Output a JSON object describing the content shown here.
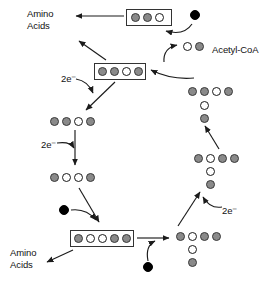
{
  "diagram": {
    "palette": {
      "gray": "#8a8a8a",
      "white": "#ffffff",
      "black": "#000000",
      "stroke": "#333333",
      "text": "#111111"
    },
    "labels": [
      {
        "id": "amino-acids-top",
        "text": "Amino\nAcids",
        "x": 27,
        "y": 8
      },
      {
        "id": "acetyl-coa",
        "text": "Acetyl-CoA",
        "x": 212,
        "y": 44
      },
      {
        "id": "two-electrons-upper",
        "text": "2e⁻",
        "x": 61,
        "y": 73
      },
      {
        "id": "two-electrons-mid",
        "text": "2e⁻",
        "x": 41,
        "y": 139
      },
      {
        "id": "two-electrons-lower",
        "text": "2e⁻",
        "x": 222,
        "y": 205
      },
      {
        "id": "amino-acids-bottom",
        "text": "Amino\nAcids",
        "x": 10,
        "y": 247
      }
    ],
    "molecules": [
      {
        "id": "molecule-top-boxed",
        "boxed": true,
        "box": {
          "x": 126,
          "y": 9,
          "w": 46,
          "h": 17
        },
        "circles": [
          {
            "fill": "gray",
            "x": 131,
            "y": 13,
            "d": 9
          },
          {
            "fill": "gray",
            "x": 143,
            "y": 13,
            "d": 9
          },
          {
            "fill": "white",
            "x": 155,
            "y": 13,
            "d": 9
          }
        ]
      },
      {
        "id": "molecule-input-top-black",
        "boxed": false,
        "circles": [
          {
            "fill": "black",
            "x": 190,
            "y": 10,
            "d": 10
          }
        ]
      },
      {
        "id": "molecule-acetyl-coa",
        "boxed": false,
        "circles": [
          {
            "fill": "white",
            "x": 183,
            "y": 42,
            "d": 9
          },
          {
            "fill": "gray",
            "x": 195,
            "y": 42,
            "d": 9
          }
        ]
      },
      {
        "id": "molecule-left-boxed-four",
        "boxed": true,
        "box": {
          "x": 94,
          "y": 63,
          "w": 52,
          "h": 17
        },
        "circles": [
          {
            "fill": "gray",
            "x": 98,
            "y": 67,
            "d": 9
          },
          {
            "fill": "gray",
            "x": 110,
            "y": 67,
            "d": 9
          },
          {
            "fill": "white",
            "x": 122,
            "y": 67,
            "d": 9
          },
          {
            "fill": "gray",
            "x": 134,
            "y": 67,
            "d": 9
          }
        ]
      },
      {
        "id": "molecule-right-branched-upper",
        "boxed": false,
        "circles": [
          {
            "fill": "gray",
            "x": 188,
            "y": 87,
            "d": 9
          },
          {
            "fill": "gray",
            "x": 200,
            "y": 87,
            "d": 9
          },
          {
            "fill": "white",
            "x": 212,
            "y": 87,
            "d": 9
          },
          {
            "fill": "gray",
            "x": 224,
            "y": 87,
            "d": 9
          },
          {
            "fill": "white",
            "x": 200,
            "y": 101,
            "d": 9
          },
          {
            "fill": "gray",
            "x": 200,
            "y": 114,
            "d": 9
          }
        ]
      },
      {
        "id": "molecule-left-four-open",
        "boxed": false,
        "circles": [
          {
            "fill": "gray",
            "x": 50,
            "y": 117,
            "d": 9
          },
          {
            "fill": "gray",
            "x": 62,
            "y": 117,
            "d": 9
          },
          {
            "fill": "white",
            "x": 74,
            "y": 117,
            "d": 9
          },
          {
            "fill": "gray",
            "x": 86,
            "y": 117,
            "d": 9
          }
        ]
      },
      {
        "id": "molecule-left-four-two-white",
        "boxed": false,
        "circles": [
          {
            "fill": "gray",
            "x": 50,
            "y": 173,
            "d": 9
          },
          {
            "fill": "white",
            "x": 62,
            "y": 173,
            "d": 9
          },
          {
            "fill": "white",
            "x": 74,
            "y": 173,
            "d": 9
          },
          {
            "fill": "gray",
            "x": 86,
            "y": 173,
            "d": 9
          }
        ]
      },
      {
        "id": "molecule-right-branched-mid",
        "boxed": false,
        "circles": [
          {
            "fill": "gray",
            "x": 194,
            "y": 154,
            "d": 9
          },
          {
            "fill": "white",
            "x": 206,
            "y": 154,
            "d": 9
          },
          {
            "fill": "gray",
            "x": 218,
            "y": 154,
            "d": 9
          },
          {
            "fill": "gray",
            "x": 230,
            "y": 154,
            "d": 9
          },
          {
            "fill": "white",
            "x": 206,
            "y": 167,
            "d": 9
          },
          {
            "fill": "gray",
            "x": 206,
            "y": 180,
            "d": 9
          }
        ]
      },
      {
        "id": "molecule-input-lower-left-black",
        "boxed": false,
        "circles": [
          {
            "fill": "black",
            "x": 59,
            "y": 205,
            "d": 10
          }
        ]
      },
      {
        "id": "molecule-bottom-boxed-five",
        "boxed": true,
        "box": {
          "x": 70,
          "y": 230,
          "w": 64,
          "h": 17
        },
        "circles": [
          {
            "fill": "gray",
            "x": 74,
            "y": 234,
            "d": 9
          },
          {
            "fill": "white",
            "x": 86,
            "y": 234,
            "d": 9
          },
          {
            "fill": "white",
            "x": 98,
            "y": 234,
            "d": 9
          },
          {
            "fill": "gray",
            "x": 110,
            "y": 234,
            "d": 9
          },
          {
            "fill": "gray",
            "x": 122,
            "y": 234,
            "d": 9
          }
        ]
      },
      {
        "id": "molecule-input-bottom-black",
        "boxed": false,
        "circles": [
          {
            "fill": "black",
            "x": 143,
            "y": 262,
            "d": 10
          }
        ]
      },
      {
        "id": "molecule-bottom-right-branched",
        "boxed": false,
        "circles": [
          {
            "fill": "gray",
            "x": 176,
            "y": 232,
            "d": 9
          },
          {
            "fill": "white",
            "x": 188,
            "y": 232,
            "d": 9
          },
          {
            "fill": "gray",
            "x": 200,
            "y": 232,
            "d": 9
          },
          {
            "fill": "gray",
            "x": 212,
            "y": 232,
            "d": 9
          },
          {
            "fill": "white",
            "x": 188,
            "y": 245,
            "d": 9
          },
          {
            "fill": "gray",
            "x": 188,
            "y": 258,
            "d": 9
          }
        ]
      }
    ],
    "arrows": [
      {
        "id": "arrow-top-to-amino",
        "kind": "straight",
        "from": [
          124,
          16
        ],
        "to": [
          76,
          16
        ]
      },
      {
        "id": "arrow-black-to-top-box",
        "kind": "curved",
        "from": [
          192,
          24
        ],
        "to": [
          166,
          31
        ],
        "ctrl": [
          184,
          36
        ]
      },
      {
        "id": "arrow-acetyl-to-cycle",
        "kind": "curved",
        "from": [
          164,
          62
        ],
        "to": [
          177,
          45
        ],
        "ctrl": [
          163,
          48
        ]
      },
      {
        "id": "arrow-right-to-left-box",
        "kind": "curved",
        "from": [
          194,
          78
        ],
        "to": [
          151,
          70
        ],
        "ctrl": [
          171,
          80
        ]
      },
      {
        "id": "arrow-leftbox-to-amino",
        "kind": "straight",
        "from": [
          106,
          60
        ],
        "to": [
          79,
          41
        ]
      },
      {
        "id": "arrow-2e-upper",
        "kind": "curved",
        "from": [
          76,
          79
        ],
        "to": [
          93,
          93
        ],
        "ctrl": [
          88,
          81
        ]
      },
      {
        "id": "arrow-leftbox-down",
        "kind": "straight",
        "from": [
          115,
          82
        ],
        "to": [
          86,
          110
        ]
      },
      {
        "id": "arrow-2e-mid",
        "kind": "curved",
        "from": [
          57,
          143
        ],
        "to": [
          74,
          148
        ],
        "ctrl": [
          70,
          141
        ]
      },
      {
        "id": "arrow-left-down-mid",
        "kind": "straight",
        "from": [
          75,
          130
        ],
        "to": [
          75,
          165
        ]
      },
      {
        "id": "arrow-left-to-bottom-box",
        "kind": "straight",
        "from": [
          79,
          188
        ],
        "to": [
          99,
          222
        ]
      },
      {
        "id": "arrow-black-to-bottom-box",
        "kind": "curved",
        "from": [
          71,
          210
        ],
        "to": [
          96,
          220
        ],
        "ctrl": [
          86,
          208
        ]
      },
      {
        "id": "arrow-bottombox-to-amino",
        "kind": "straight",
        "from": [
          73,
          250
        ],
        "to": [
          47,
          262
        ]
      },
      {
        "id": "arrow-bottombox-to-right",
        "kind": "straight",
        "from": [
          137,
          238
        ],
        "to": [
          169,
          238
        ]
      },
      {
        "id": "arrow-black-to-bottom-right",
        "kind": "curved",
        "from": [
          148,
          261
        ],
        "to": [
          155,
          241
        ],
        "ctrl": [
          145,
          246
        ]
      },
      {
        "id": "arrow-bottom-right-up",
        "kind": "straight",
        "from": [
          178,
          226
        ],
        "to": [
          200,
          192
        ]
      },
      {
        "id": "arrow-2e-lower",
        "kind": "curved",
        "from": [
          222,
          207
        ],
        "to": [
          203,
          197
        ],
        "ctrl": [
          210,
          209
        ]
      },
      {
        "id": "arrow-mid-right-up",
        "kind": "straight",
        "from": [
          219,
          149
        ],
        "to": [
          205,
          126
        ]
      }
    ]
  }
}
